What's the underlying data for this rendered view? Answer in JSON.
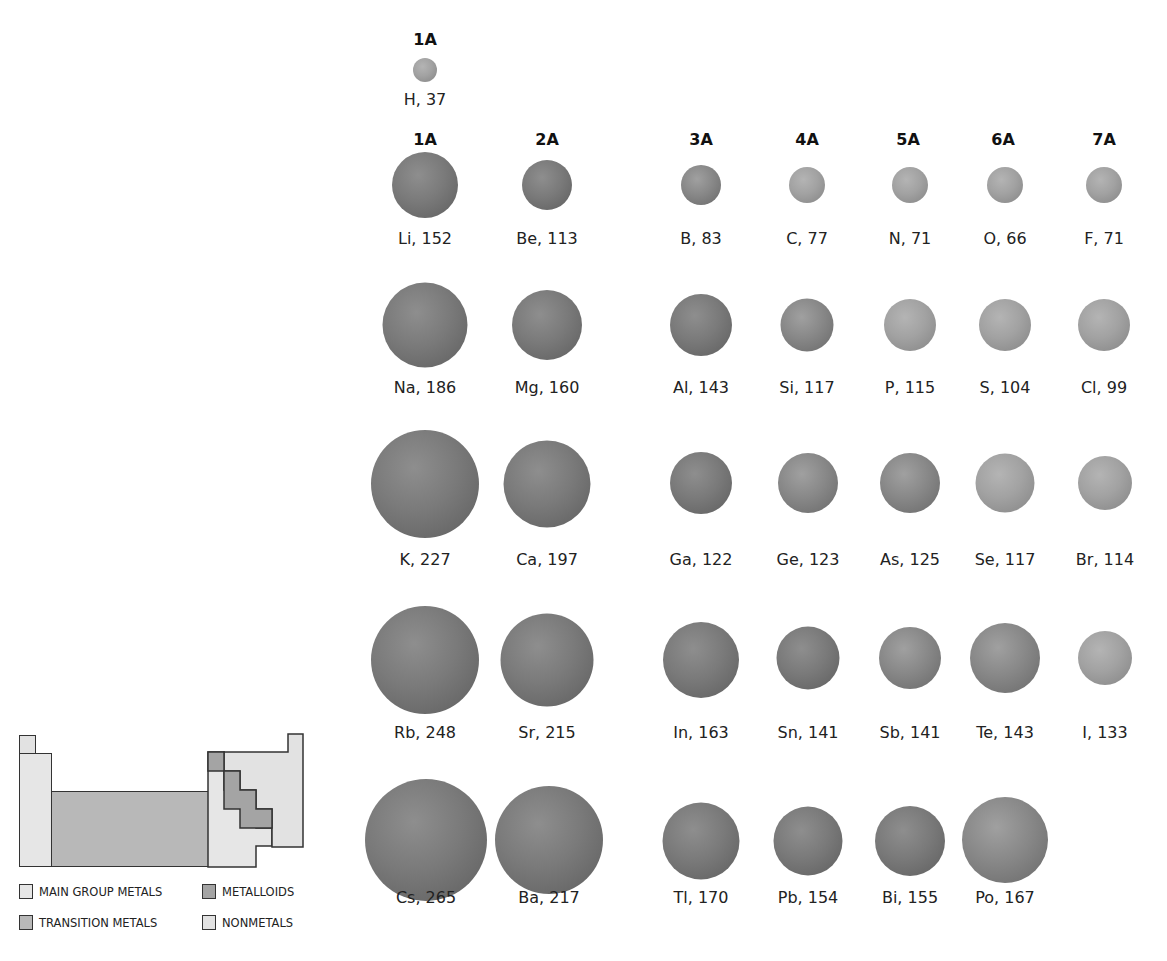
{
  "colors": {
    "main_group_metals": "#e6e6e6",
    "transition_metals": "#b8b8b8",
    "metalloids": "#a4a4a4",
    "nonmetals": "#e2e2e2",
    "outline": "#333333"
  },
  "hydrogen_header": "1A",
  "group_headers": [
    {
      "label": "1A",
      "x": 425
    },
    {
      "label": "2A",
      "x": 547
    },
    {
      "label": "3A",
      "x": 701
    },
    {
      "label": "4A",
      "x": 807
    },
    {
      "label": "5A",
      "x": 908
    },
    {
      "label": "6A",
      "x": 1003
    },
    {
      "label": "7A",
      "x": 1104
    }
  ],
  "legend": {
    "main_group_metals": "MAIN GROUP METALS",
    "transition_metals": "TRANSITION METALS",
    "metalloids": "METALLOIDS",
    "nonmetals": "NONMETALS"
  },
  "elements": [
    {
      "symbol": "H",
      "radius": 37,
      "label": "H, 37",
      "x": 425,
      "y": 70,
      "d": 24,
      "type": "nonmetal",
      "ly": 90
    },
    {
      "symbol": "Li",
      "radius": 152,
      "label": "Li, 152",
      "x": 425,
      "y": 185,
      "d": 66,
      "type": "metal",
      "ly": 229
    },
    {
      "symbol": "Be",
      "radius": 113,
      "label": "Be, 113",
      "x": 547,
      "y": 185,
      "d": 50,
      "type": "metal",
      "ly": 229
    },
    {
      "symbol": "B",
      "radius": 83,
      "label": "B, 83",
      "x": 701,
      "y": 185,
      "d": 40,
      "type": "metalloid",
      "ly": 229
    },
    {
      "symbol": "C",
      "radius": 77,
      "label": "C, 77",
      "x": 807,
      "y": 185,
      "d": 36,
      "type": "nonmetal",
      "ly": 229
    },
    {
      "symbol": "N",
      "radius": 71,
      "label": "N, 71",
      "x": 910,
      "y": 185,
      "d": 36,
      "type": "nonmetal",
      "ly": 229
    },
    {
      "symbol": "O",
      "radius": 66,
      "label": "O, 66",
      "x": 1005,
      "y": 185,
      "d": 36,
      "type": "nonmetal",
      "ly": 229
    },
    {
      "symbol": "F",
      "radius": 71,
      "label": "F, 71",
      "x": 1104,
      "y": 185,
      "d": 36,
      "type": "nonmetal",
      "ly": 229
    },
    {
      "symbol": "Na",
      "radius": 186,
      "label": "Na, 186",
      "x": 425,
      "y": 325,
      "d": 85,
      "type": "metal",
      "ly": 378
    },
    {
      "symbol": "Mg",
      "radius": 160,
      "label": "Mg, 160",
      "x": 547,
      "y": 325,
      "d": 70,
      "type": "metal",
      "ly": 378
    },
    {
      "symbol": "Al",
      "radius": 143,
      "label": "Al, 143",
      "x": 701,
      "y": 325,
      "d": 62,
      "type": "metal",
      "ly": 378
    },
    {
      "symbol": "Si",
      "radius": 117,
      "label": "Si, 117",
      "x": 807,
      "y": 325,
      "d": 53,
      "type": "metalloid",
      "ly": 378
    },
    {
      "symbol": "P",
      "radius": 115,
      "label": "P, 115",
      "x": 910,
      "y": 325,
      "d": 52,
      "type": "nonmetal",
      "ly": 378
    },
    {
      "symbol": "S",
      "radius": 104,
      "label": "S, 104",
      "x": 1005,
      "y": 325,
      "d": 52,
      "type": "nonmetal",
      "ly": 378
    },
    {
      "symbol": "Cl",
      "radius": 99,
      "label": "Cl, 99",
      "x": 1104,
      "y": 325,
      "d": 52,
      "type": "nonmetal",
      "ly": 378
    },
    {
      "symbol": "K",
      "radius": 227,
      "label": "K, 227",
      "x": 425,
      "y": 484,
      "d": 108,
      "type": "metal",
      "ly": 550
    },
    {
      "symbol": "Ca",
      "radius": 197,
      "label": "Ca, 197",
      "x": 547,
      "y": 484,
      "d": 87,
      "type": "metal",
      "ly": 550
    },
    {
      "symbol": "Ga",
      "radius": 122,
      "label": "Ga, 122",
      "x": 701,
      "y": 483,
      "d": 62,
      "type": "metal",
      "ly": 550
    },
    {
      "symbol": "Ge",
      "radius": 123,
      "label": "Ge, 123",
      "x": 808,
      "y": 483,
      "d": 60,
      "type": "metalloid",
      "ly": 550
    },
    {
      "symbol": "As",
      "radius": 125,
      "label": "As, 125",
      "x": 910,
      "y": 483,
      "d": 60,
      "type": "metalloid",
      "ly": 550
    },
    {
      "symbol": "Se",
      "radius": 117,
      "label": "Se, 117",
      "x": 1005,
      "y": 483,
      "d": 59,
      "type": "nonmetal",
      "ly": 550
    },
    {
      "symbol": "Br",
      "radius": 114,
      "label": "Br, 114",
      "x": 1105,
      "y": 483,
      "d": 54,
      "type": "nonmetal",
      "ly": 550
    },
    {
      "symbol": "Rb",
      "radius": 248,
      "label": "Rb, 248",
      "x": 425,
      "y": 660,
      "d": 108,
      "type": "metal",
      "ly": 723
    },
    {
      "symbol": "Sr",
      "radius": 215,
      "label": "Sr, 215",
      "x": 547,
      "y": 660,
      "d": 93,
      "type": "metal",
      "ly": 723
    },
    {
      "symbol": "In",
      "radius": 163,
      "label": "In, 163",
      "x": 701,
      "y": 660,
      "d": 76,
      "type": "metal",
      "ly": 723
    },
    {
      "symbol": "Sn",
      "radius": 141,
      "label": "Sn, 141",
      "x": 808,
      "y": 658,
      "d": 63,
      "type": "metal",
      "ly": 723
    },
    {
      "symbol": "Sb",
      "radius": 141,
      "label": "Sb, 141",
      "x": 910,
      "y": 658,
      "d": 62,
      "type": "metalloid",
      "ly": 723
    },
    {
      "symbol": "Te",
      "radius": 143,
      "label": "Te, 143",
      "x": 1005,
      "y": 658,
      "d": 70,
      "type": "metalloid",
      "ly": 723
    },
    {
      "symbol": "I",
      "radius": 133,
      "label": "I, 133",
      "x": 1105,
      "y": 658,
      "d": 54,
      "type": "nonmetal",
      "ly": 723
    },
    {
      "symbol": "Cs",
      "radius": 265,
      "label": "Cs, 265",
      "x": 426,
      "y": 840,
      "d": 122,
      "type": "metal",
      "ly": 888
    },
    {
      "symbol": "Ba",
      "radius": 217,
      "label": "Ba, 217",
      "x": 549,
      "y": 840,
      "d": 108,
      "type": "metal",
      "ly": 888
    },
    {
      "symbol": "Tl",
      "radius": 170,
      "label": "Tl, 170",
      "x": 701,
      "y": 841,
      "d": 77,
      "type": "metal",
      "ly": 888
    },
    {
      "symbol": "Pb",
      "radius": 154,
      "label": "Pb, 154",
      "x": 808,
      "y": 841,
      "d": 69,
      "type": "metal",
      "ly": 888
    },
    {
      "symbol": "Bi",
      "radius": 155,
      "label": "Bi, 155",
      "x": 910,
      "y": 841,
      "d": 70,
      "type": "metal",
      "ly": 888
    },
    {
      "symbol": "Po",
      "radius": 167,
      "label": "Po, 167",
      "x": 1005,
      "y": 840,
      "d": 86,
      "type": "metalloid",
      "ly": 888
    }
  ]
}
